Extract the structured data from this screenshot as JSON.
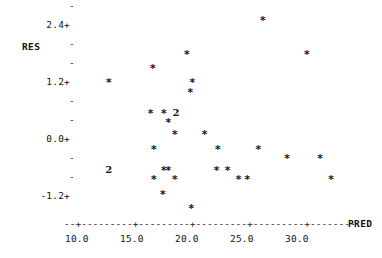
{
  "plot": {
    "type": "character-scatter",
    "y_axis_title": "RES",
    "x_axis_title": "PRED",
    "y_tick_labels": [
      "2.4+",
      "1.2+",
      "0.0+",
      "-1.2+"
    ],
    "y_tick_values": [
      2.4,
      1.2,
      0.0,
      -1.2
    ],
    "x_tick_labels": [
      "10.0",
      "15.0",
      "20.0",
      "25.0",
      "30.0"
    ],
    "x_tick_values": [
      10.0,
      15.0,
      20.0,
      25.0,
      30.0
    ],
    "y_minor_dash": "-",
    "x_axis_dash": "-",
    "x_axis_plus": "+",
    "star_glyph": "*",
    "overlap_glyph_2": "2"
  },
  "chart_data": {
    "type": "scatter",
    "title": "",
    "xlabel": "PRED",
    "ylabel": "RES",
    "xlim": [
      8.6,
      35.0
    ],
    "ylim": [
      -1.95,
      2.85
    ],
    "grid": false,
    "legend": "none",
    "xticks": [
      10.0,
      15.0,
      20.0,
      25.0,
      30.0
    ],
    "yticks": [
      -1.2,
      0.0,
      1.2,
      2.4
    ],
    "marker": "*",
    "points": [
      {
        "x": 12.8,
        "y": 1.2,
        "glyph": "*",
        "count": 1
      },
      {
        "x": 16.8,
        "y": 1.5,
        "glyph": "*",
        "count": 1
      },
      {
        "x": 19.9,
        "y": 1.8,
        "glyph": "*",
        "count": 1
      },
      {
        "x": 20.4,
        "y": 1.2,
        "glyph": "*",
        "count": 1
      },
      {
        "x": 20.2,
        "y": 1.0,
        "glyph": "*",
        "count": 1
      },
      {
        "x": 26.8,
        "y": 2.5,
        "glyph": "*",
        "count": 1
      },
      {
        "x": 30.8,
        "y": 1.8,
        "glyph": "*",
        "count": 1
      },
      {
        "x": 16.6,
        "y": 0.55,
        "glyph": "*",
        "count": 1
      },
      {
        "x": 17.8,
        "y": 0.55,
        "glyph": "*",
        "count": 1
      },
      {
        "x": 18.9,
        "y": 0.55,
        "glyph": "2",
        "count": 2
      },
      {
        "x": 18.2,
        "y": 0.35,
        "glyph": "*",
        "count": 1
      },
      {
        "x": 18.8,
        "y": 0.1,
        "glyph": "*",
        "count": 1
      },
      {
        "x": 21.5,
        "y": 0.1,
        "glyph": "*",
        "count": 1
      },
      {
        "x": 16.9,
        "y": -0.2,
        "glyph": "*",
        "count": 1
      },
      {
        "x": 22.7,
        "y": -0.2,
        "glyph": "*",
        "count": 1
      },
      {
        "x": 26.4,
        "y": -0.2,
        "glyph": "*",
        "count": 1
      },
      {
        "x": 29.0,
        "y": -0.4,
        "glyph": "*",
        "count": 1
      },
      {
        "x": 32.0,
        "y": -0.4,
        "glyph": "*",
        "count": 1
      },
      {
        "x": 12.8,
        "y": -0.65,
        "glyph": "2",
        "count": 2
      },
      {
        "x": 17.8,
        "y": -0.65,
        "glyph": "*",
        "count": 1
      },
      {
        "x": 18.2,
        "y": -0.65,
        "glyph": "*",
        "count": 1
      },
      {
        "x": 22.6,
        "y": -0.65,
        "glyph": "*",
        "count": 1
      },
      {
        "x": 23.6,
        "y": -0.65,
        "glyph": "*",
        "count": 1
      },
      {
        "x": 16.9,
        "y": -0.85,
        "glyph": "*",
        "count": 1
      },
      {
        "x": 18.8,
        "y": -0.85,
        "glyph": "*",
        "count": 1
      },
      {
        "x": 24.6,
        "y": -0.85,
        "glyph": "*",
        "count": 1
      },
      {
        "x": 25.4,
        "y": -0.85,
        "glyph": "*",
        "count": 1
      },
      {
        "x": 33.0,
        "y": -0.85,
        "glyph": "*",
        "count": 1
      },
      {
        "x": 17.7,
        "y": -1.15,
        "glyph": "*",
        "count": 1
      },
      {
        "x": 20.3,
        "y": -1.45,
        "glyph": "*",
        "count": 1
      }
    ]
  }
}
